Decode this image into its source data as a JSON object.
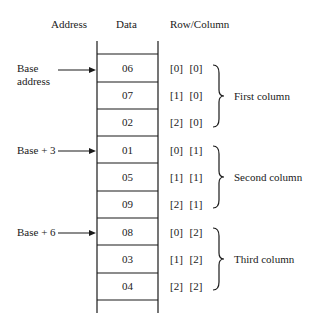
{
  "headers": {
    "address": "Address",
    "data": "Data",
    "rowcol": "Row/Column"
  },
  "cells": [
    {
      "value": "06",
      "index": "[0]  [0]"
    },
    {
      "value": "07",
      "index": "[1]  [0]"
    },
    {
      "value": "02",
      "index": "[2]  [0]"
    },
    {
      "value": "01",
      "index": "[0]  [1]"
    },
    {
      "value": "05",
      "index": "[1]  [1]"
    },
    {
      "value": "09",
      "index": "[2]  [1]"
    },
    {
      "value": "08",
      "index": "[0]  [2]"
    },
    {
      "value": "03",
      "index": "[1]  [2]"
    },
    {
      "value": "04",
      "index": "[2]  [2]"
    }
  ],
  "addresses": {
    "base_line1": "Base",
    "base_line2": "address",
    "base3": "Base + 3",
    "base6": "Base + 6"
  },
  "groups": {
    "first": "First column",
    "second": "Second column",
    "third": "Third column"
  },
  "colors": {
    "line": "#1a1a1a",
    "background": "#ffffff"
  }
}
